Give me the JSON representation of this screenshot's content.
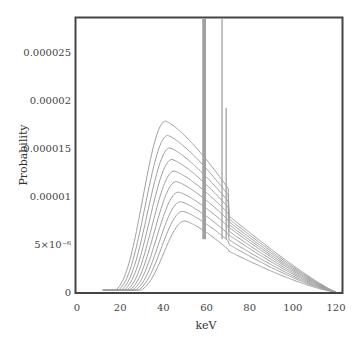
{
  "chart_data": {
    "type": "line",
    "title": "",
    "xlabel": "keV",
    "ylabel": "Probability",
    "xlim": [
      0,
      120
    ],
    "ylim": [
      0,
      2.85e-05
    ],
    "grid": false,
    "legend": null,
    "x_ticks": [
      "0",
      "20",
      "40",
      "60",
      "80",
      "100",
      "120"
    ],
    "y_ticks": [
      "0",
      "5×10⁻⁶",
      "0.00001",
      "0.000015",
      "0.00002",
      "0.000025"
    ],
    "y_tick_values": [
      0,
      5e-06,
      1e-05,
      1.5e-05,
      2e-05,
      2.5e-05
    ],
    "x_tick_values": [
      0,
      20,
      40,
      60,
      80,
      100,
      120
    ],
    "series_description": "Ten X-ray tube energy spectra (family of curves) with characteristic tungsten lines near 58-59, 67 and 69 keV",
    "series": [
      {
        "name": "spectrum 1",
        "peak_keV": 41,
        "peak_prob": 1.78e-05,
        "at_70keV": 8e-06
      },
      {
        "name": "spectrum 2",
        "peak_keV": 42,
        "peak_prob": 1.63e-05,
        "at_70keV": 7.7e-06
      },
      {
        "name": "spectrum 3",
        "peak_keV": 43,
        "peak_prob": 1.5e-05,
        "at_70keV": 7.4e-06
      },
      {
        "name": "spectrum 4",
        "peak_keV": 44,
        "peak_prob": 1.38e-05,
        "at_70keV": 7.1e-06
      },
      {
        "name": "spectrum 5",
        "peak_keV": 45,
        "peak_prob": 1.26e-05,
        "at_70keV": 6.8e-06
      },
      {
        "name": "spectrum 6",
        "peak_keV": 46,
        "peak_prob": 1.15e-05,
        "at_70keV": 6.4e-06
      },
      {
        "name": "spectrum 7",
        "peak_keV": 47,
        "peak_prob": 1.04e-05,
        "at_70keV": 6e-06
      },
      {
        "name": "spectrum 8",
        "peak_keV": 48,
        "peak_prob": 9.4e-06,
        "at_70keV": 5.5e-06
      },
      {
        "name": "spectrum 9",
        "peak_keV": 49,
        "peak_prob": 8.4e-06,
        "at_70keV": 5e-06
      },
      {
        "name": "spectrum 10",
        "peak_keV": 50,
        "peak_prob": 7.4e-06,
        "at_70keV": 4.3e-06
      }
    ],
    "characteristic_lines": [
      {
        "keV": 58.5,
        "height": ">0.0000285 (clipped)"
      },
      {
        "keV": 59.3,
        "height": ">0.0000285 (clipped)"
      },
      {
        "keV": 67.2,
        "height": ">0.0000285 (clipped)"
      },
      {
        "keV": 69.1,
        "height": 1.92e-05
      }
    ],
    "x_start_keV": 12,
    "x_end_keV": 120,
    "line_color": "#a0a0a0",
    "frame_color": "#444444"
  }
}
